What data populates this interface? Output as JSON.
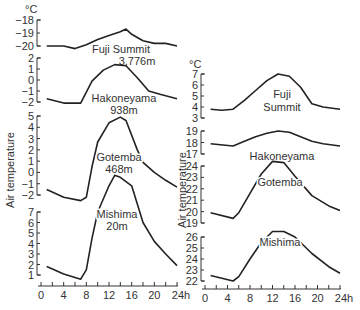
{
  "chart_data": [
    {
      "type": "line",
      "title": "Diurnal air temperature variation (winter) at stations of different altitude",
      "ylabel": "Air temperature",
      "yunit": "°C",
      "xlabel": "h",
      "x_ticks": [
        "0",
        "4",
        "8",
        "12",
        "16",
        "20",
        "24h"
      ],
      "panels": [
        {
          "name": "Fuji Summit",
          "altitude": "3,776m",
          "y_ticks": [
            "-18",
            "-19",
            "-20"
          ],
          "ylim": [
            -20,
            -18
          ],
          "x": [
            1,
            4,
            6,
            8,
            10,
            12,
            14,
            15,
            16,
            18,
            20,
            22,
            24
          ],
          "values": [
            -20,
            -20,
            -20.2,
            -19.9,
            -19.5,
            -19.2,
            -18.9,
            -18.7,
            -19.1,
            -19.6,
            -19.8,
            -19.8,
            -20
          ]
        },
        {
          "name": "Hakoneyama",
          "altitude": "938m",
          "y_ticks": [
            "2",
            "1",
            "0",
            "-1",
            "-2"
          ],
          "ylim": [
            -2,
            2
          ],
          "x": [
            1,
            4,
            7,
            9,
            11,
            13,
            15,
            17,
            19,
            21,
            24
          ],
          "values": [
            -1.7,
            -2.1,
            -2.1,
            -0.1,
            0.9,
            1.4,
            1.3,
            0.2,
            -1.0,
            -1.3,
            -1.7
          ]
        },
        {
          "name": "Gotemba",
          "altitude": "468m",
          "y_ticks": [
            "5",
            "4",
            "3",
            "2",
            "1",
            "0",
            "-1",
            "-2"
          ],
          "ylim": [
            -2,
            5
          ],
          "x": [
            1,
            4,
            7,
            8,
            9,
            10,
            12,
            14,
            15,
            17,
            18,
            20,
            22,
            24
          ],
          "values": [
            -1.5,
            -2.2,
            -2.5,
            -2.2,
            0.5,
            2.7,
            4.4,
            4.9,
            4.6,
            2.0,
            0.9,
            0.0,
            -0.7,
            -1.3
          ]
        },
        {
          "name": "Mishima",
          "altitude": "20m",
          "y_ticks": [
            "7",
            "6",
            "5",
            "4",
            "3",
            "2",
            "1"
          ],
          "ylim": [
            1,
            7
          ],
          "x": [
            1,
            4,
            7,
            8,
            9,
            10,
            12,
            13,
            14,
            16,
            18,
            20,
            22,
            24
          ],
          "values": [
            1.8,
            1.1,
            0.6,
            1.5,
            4.5,
            7.0,
            9.5,
            10.5,
            10.3,
            9.5,
            6.0,
            4.2,
            3.0,
            1.9
          ]
        }
      ]
    },
    {
      "type": "line",
      "title": "Diurnal air temperature variation (summer) at stations of different altitude",
      "ylabel": "Air temperature",
      "yunit": "°C",
      "xlabel": "h",
      "x_ticks": [
        "0",
        "4",
        "8",
        "12",
        "16",
        "20",
        "24h"
      ],
      "panels": [
        {
          "name": "Fuji Summit",
          "y_ticks": [
            "7",
            "6",
            "5",
            "4",
            "3"
          ],
          "ylim": [
            3,
            7
          ],
          "x": [
            1,
            3,
            5,
            7,
            9,
            11,
            13,
            15,
            17,
            19,
            21,
            24
          ],
          "values": [
            3.8,
            3.7,
            3.8,
            4.6,
            5.5,
            6.4,
            7.0,
            6.8,
            5.8,
            4.3,
            4.0,
            3.8
          ]
        },
        {
          "name": "Hakoneyama",
          "y_ticks": [
            "19",
            "18",
            "17"
          ],
          "ylim": [
            17,
            19
          ],
          "x": [
            1,
            5,
            7,
            9,
            11,
            13,
            15,
            17,
            19,
            21,
            24
          ],
          "values": [
            17.9,
            17.7,
            18.1,
            18.5,
            18.8,
            19.0,
            18.9,
            18.5,
            18.1,
            17.9,
            17.7
          ]
        },
        {
          "name": "Gotemba",
          "y_ticks": [
            "24",
            "23",
            "22",
            "21",
            "20",
            "19"
          ],
          "ylim": [
            19,
            24
          ],
          "x": [
            1,
            5,
            6,
            8,
            10,
            12,
            14,
            16,
            19,
            22,
            24
          ],
          "values": [
            19.9,
            19.4,
            19.9,
            21.6,
            23.3,
            24.4,
            24.3,
            23.1,
            21.4,
            20.5,
            20.1
          ]
        },
        {
          "name": "Mishima",
          "y_ticks": [
            "26",
            "25",
            "24",
            "23",
            "22"
          ],
          "ylim": [
            22,
            26
          ],
          "x": [
            1,
            5,
            6,
            8,
            10,
            12,
            14,
            16,
            19,
            22,
            24
          ],
          "values": [
            22.5,
            22.0,
            22.4,
            24.0,
            25.5,
            26.5,
            26.5,
            26.0,
            24.5,
            23.3,
            22.7
          ]
        }
      ]
    }
  ],
  "labels": {
    "unit": "°C",
    "ylabel": "Air  temperature",
    "left": {
      "fuji_name": "Fuji Summit",
      "fuji_alt": "3,776m",
      "hakone_name": "Hakoneyama",
      "hakone_alt": "938m",
      "gotemba_name": "Gotemba",
      "gotemba_alt": "468m",
      "mishima_name": "Mishima",
      "mishima_alt": "20m"
    },
    "right": {
      "fuji_name1": "Fuji",
      "fuji_name2": "Summit",
      "hakone_name": "Hakoneyama",
      "gotemba_name": "Gotemba",
      "mishima_name": "Mishima"
    }
  }
}
